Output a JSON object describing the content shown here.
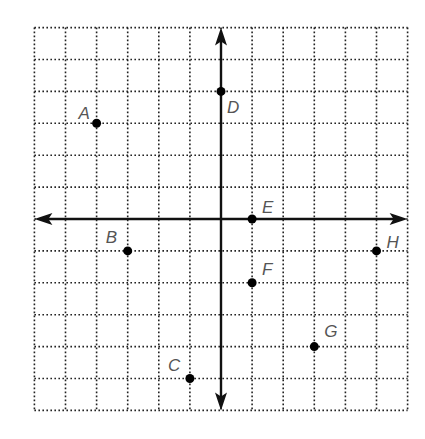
{
  "diagram": {
    "type": "coordinate-grid",
    "grid": {
      "x_min": -6,
      "x_max": 6,
      "y_min": -6,
      "y_max": 6,
      "step": 1,
      "style": "dotted"
    },
    "origin_px": {
      "x": 221,
      "y": 219
    },
    "unit_px": {
      "x": 31.1,
      "y": 31.9
    },
    "axis_color": "#111111",
    "grid_color": "#222222",
    "points": [
      {
        "label": "A",
        "x": -4,
        "y": 3,
        "label_dx": -18,
        "label_dy": -4
      },
      {
        "label": "B",
        "x": -3,
        "y": -1,
        "label_dx": -22,
        "label_dy": -8
      },
      {
        "label": "C",
        "x": -1,
        "y": -5,
        "label_dx": -22,
        "label_dy": -8
      },
      {
        "label": "D",
        "x": 0,
        "y": 4,
        "label_dx": 6,
        "label_dy": 22
      },
      {
        "label": "E",
        "x": 1,
        "y": 0,
        "label_dx": 10,
        "label_dy": -6
      },
      {
        "label": "F",
        "x": 1,
        "y": -2,
        "label_dx": 10,
        "label_dy": -8
      },
      {
        "label": "G",
        "x": 3,
        "y": -4,
        "label_dx": 10,
        "label_dy": -10
      },
      {
        "label": "H",
        "x": 5,
        "y": -1,
        "label_dx": 10,
        "label_dy": -3
      }
    ]
  }
}
